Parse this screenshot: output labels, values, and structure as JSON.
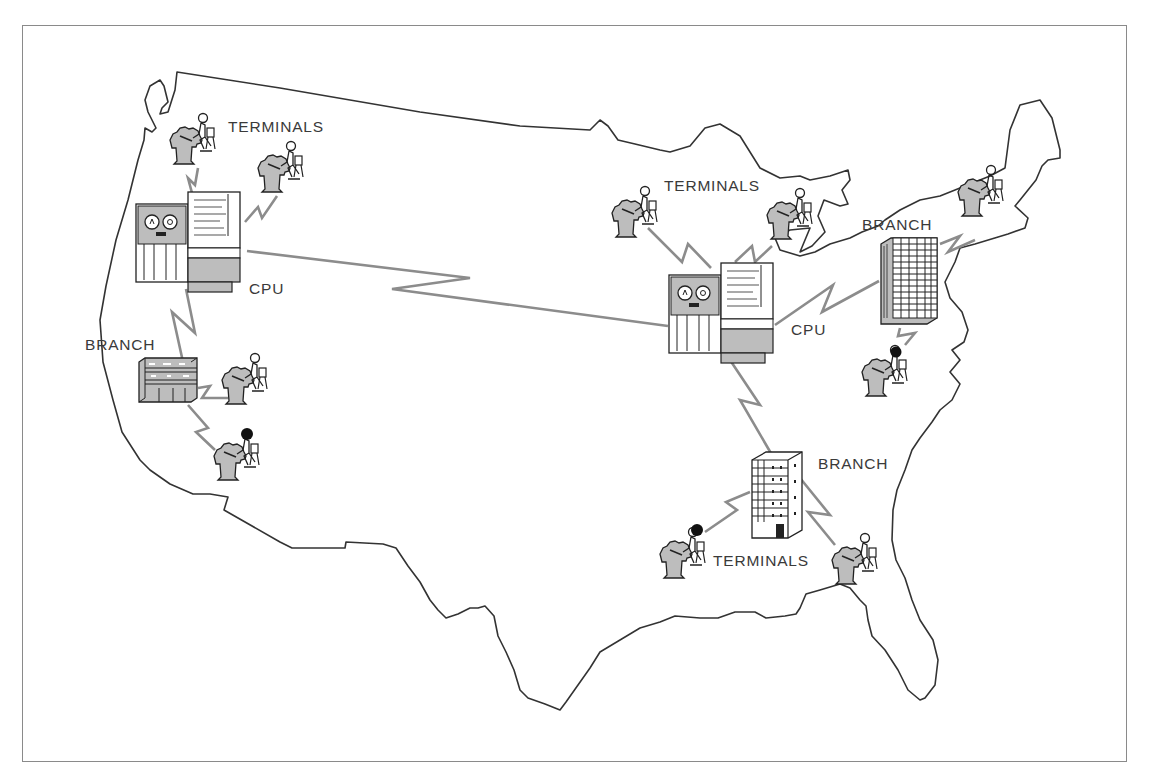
{
  "diagram": {
    "title": "",
    "colors": {
      "map_outline": "#3a3a3a",
      "link_line": "#8c8c8c",
      "equipment_fill": "#bdbdbd",
      "frame": "#8a8a8a",
      "text": "#3a3a3a"
    },
    "labels": {
      "west_terminals": "TERMINALS",
      "west_cpu": "CPU",
      "west_branch": "BRANCH",
      "central_terminals": "TERMINALS",
      "central_cpu": "CPU",
      "northeast_branch": "BRANCH",
      "southeast_branch": "BRANCH",
      "southeast_terminals": "TERMINALS"
    },
    "nodes": [
      {
        "id": "west-cpu",
        "type": "cpu",
        "label": "CPU"
      },
      {
        "id": "west-terminal-1",
        "type": "terminal"
      },
      {
        "id": "west-terminal-2",
        "type": "terminal"
      },
      {
        "id": "west-branch",
        "type": "branch",
        "label": "BRANCH"
      },
      {
        "id": "west-branch-terminal-1",
        "type": "terminal"
      },
      {
        "id": "west-branch-terminal-2",
        "type": "terminal"
      },
      {
        "id": "central-cpu",
        "type": "cpu",
        "label": "CPU"
      },
      {
        "id": "central-terminal-1",
        "type": "terminal"
      },
      {
        "id": "central-terminal-2",
        "type": "terminal"
      },
      {
        "id": "northeast-branch",
        "type": "branch",
        "label": "BRANCH"
      },
      {
        "id": "northeast-terminal-1",
        "type": "terminal"
      },
      {
        "id": "northeast-terminal-2",
        "type": "terminal"
      },
      {
        "id": "southeast-branch",
        "type": "branch",
        "label": "BRANCH"
      },
      {
        "id": "southeast-terminal-1",
        "type": "terminal"
      },
      {
        "id": "southeast-terminal-2",
        "type": "terminal"
      }
    ],
    "links": [
      [
        "west-cpu",
        "central-cpu"
      ],
      [
        "west-cpu",
        "west-terminal-1"
      ],
      [
        "west-cpu",
        "west-terminal-2"
      ],
      [
        "west-cpu",
        "west-branch"
      ],
      [
        "west-branch",
        "west-branch-terminal-1"
      ],
      [
        "west-branch",
        "west-branch-terminal-2"
      ],
      [
        "central-cpu",
        "central-terminal-1"
      ],
      [
        "central-cpu",
        "central-terminal-2"
      ],
      [
        "central-cpu",
        "northeast-branch"
      ],
      [
        "central-cpu",
        "southeast-branch"
      ],
      [
        "northeast-branch",
        "northeast-terminal-1"
      ],
      [
        "northeast-branch",
        "northeast-terminal-2"
      ],
      [
        "southeast-branch",
        "southeast-terminal-1"
      ],
      [
        "southeast-branch",
        "southeast-terminal-2"
      ]
    ]
  }
}
